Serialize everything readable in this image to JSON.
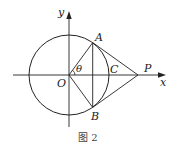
{
  "figure": {
    "caption": "图 2",
    "labels": {
      "y_axis": "y",
      "x_axis": "x",
      "origin": "O",
      "point_a": "A",
      "point_b": "B",
      "point_c": "C",
      "point_p": "P",
      "angle": "θ"
    },
    "geometry": {
      "circle_center": [
        69,
        75
      ],
      "radius": 40,
      "A": [
        92.7,
        42.6
      ],
      "B": [
        92.7,
        107.4
      ],
      "C": [
        109,
        75
      ],
      "P": [
        138,
        75
      ]
    },
    "colors": {
      "stroke": "#222222",
      "background": "#ffffff"
    }
  }
}
